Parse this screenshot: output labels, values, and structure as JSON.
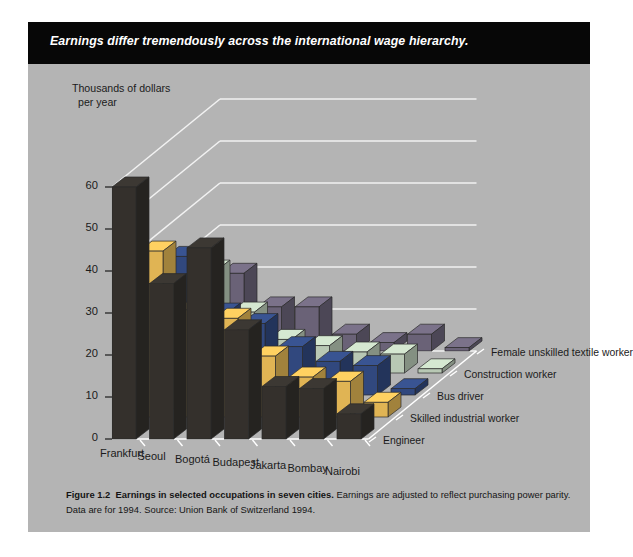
{
  "banner": {
    "text": "Earnings differ tremendously across the international wage hierarchy."
  },
  "caption": {
    "figure_label": "Figure 1.2",
    "bold_title": "Earnings in selected occupations in seven cities.",
    "body": " Earnings are adjusted to reflect purchasing power parity. Data are for 1994. Source: Union Bank of Switzerland 1994."
  },
  "axis": {
    "ylabel_line1": "Thousands of dollars",
    "ylabel_line2": "per year",
    "yticks": [
      "60",
      "50",
      "40",
      "30",
      "20",
      "10",
      "0"
    ]
  },
  "colors": {
    "panel_bg": "#b4b4b4",
    "banner_bg": "#070707",
    "gridline": "#f2f2f2",
    "engineer": "#34302c",
    "skilled_industrial_worker": "#e0b454",
    "bus_driver": "#31487e",
    "construction_worker": "#b8c8b4",
    "female_unskilled_textile_worker": "#6a6277"
  },
  "chart_data": {
    "type": "bar",
    "title": "Earnings differ tremendously across the international wage hierarchy.",
    "subtitle": "Earnings in selected occupations in seven cities.",
    "xlabel": "",
    "ylabel": "Thousands of dollars per year",
    "ylim": [
      0,
      60
    ],
    "ytick_step": 10,
    "grid": true,
    "projection": "3d-isometric",
    "legend_position": "right",
    "categories": [
      "Frankfurt",
      "Seoul",
      "Bogotá",
      "Budapest",
      "Jakarta",
      "Bombay",
      "Nairobi"
    ],
    "series": [
      {
        "name": "Engineer",
        "color": "#34302c",
        "values": [
          60.0,
          37.0,
          45.5,
          26.0,
          12.5,
          12.0,
          6.0
        ]
      },
      {
        "name": "Skilled industrial worker",
        "color": "#e0b454",
        "values": [
          39.5,
          25.5,
          23.5,
          14.5,
          9.5,
          8.5,
          3.5
        ]
      },
      {
        "name": "Bus driver",
        "color": "#31487e",
        "values": [
          33.0,
          19.5,
          17.0,
          11.5,
          8.0,
          7.0,
          1.5
        ]
      },
      {
        "name": "Construction worker",
        "color": "#b8c8b4",
        "values": [
          24.5,
          14.5,
          8.0,
          6.5,
          5.0,
          4.5,
          1.0
        ]
      },
      {
        "name": "Female unskilled textile worker",
        "color": "#6a6277",
        "values": [
          18.5,
          10.5,
          10.5,
          4.0,
          2.0,
          4.0,
          0.8
        ]
      }
    ]
  },
  "legend": {
    "items": [
      {
        "label": "Engineer"
      },
      {
        "label": "Skilled industrial worker"
      },
      {
        "label": "Bus driver"
      },
      {
        "label": "Construction worker"
      },
      {
        "label": "Female unskilled textile worker"
      }
    ]
  }
}
